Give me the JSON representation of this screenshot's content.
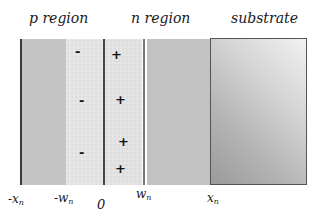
{
  "diagram": {
    "regions": [
      {
        "id": "p",
        "title": "p region"
      },
      {
        "id": "n",
        "title": "n region"
      },
      {
        "id": "substrate",
        "title": "substrate"
      }
    ],
    "axis_labels": [
      {
        "id": "neg-xn",
        "prefix": "-x",
        "sub": "n"
      },
      {
        "id": "neg-wn",
        "prefix": "-w",
        "sub": "n"
      },
      {
        "id": "zero",
        "prefix": "0",
        "sub": ""
      },
      {
        "id": "wn",
        "prefix": "w",
        "sub": "n"
      },
      {
        "id": "xn",
        "prefix": "x",
        "sub": "n"
      }
    ],
    "charges": {
      "negative_symbol": "-",
      "positive_symbol": "+",
      "negative_count": 3,
      "positive_count": 4
    },
    "colors": {
      "bulk_fill": "#c4c4c4",
      "depletion_fill": "#e6e6e6",
      "boundary_line": "#3a3a3a",
      "substrate_border": "#555555"
    }
  }
}
